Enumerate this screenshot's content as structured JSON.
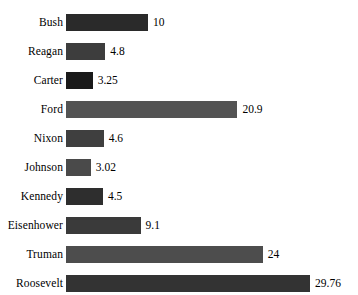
{
  "page": {
    "title_remnant": "",
    "background": "#ffffff",
    "text_color": "#000000"
  },
  "chart_data": {
    "type": "bar",
    "orientation": "horizontal",
    "title": "",
    "subtitle": "",
    "xlabel": "",
    "ylabel": "",
    "grid": false,
    "legend": null,
    "axis_visible": false,
    "xlim": [
      0,
      29.76
    ],
    "categories": [
      "Bush",
      "Reagan",
      "Carter",
      "Ford",
      "Nixon",
      "Johnson",
      "Kennedy",
      "Eisenhower",
      "Truman",
      "Roosevelt"
    ],
    "values": [
      10,
      4.8,
      3.25,
      20.9,
      4.6,
      3.02,
      4.5,
      9.1,
      24,
      29.76
    ],
    "value_labels": [
      "10",
      "4.8",
      "3.25",
      "20.9",
      "4.6",
      "3.02",
      "4.5",
      "9.1",
      "24",
      "29.76"
    ],
    "bar_colors": [
      "#2a2a2a",
      "#3d3d3d",
      "#1a1a1a",
      "#535353",
      "#3f3f3f",
      "#4a4a4a",
      "#2e2e2e",
      "#3a3a3a",
      "#4d4d4d",
      "#333333"
    ],
    "bars": [
      {
        "category": "Bush",
        "value": 10,
        "label": "10",
        "color": "#2a2a2a"
      },
      {
        "category": "Reagan",
        "value": 4.8,
        "label": "4.8",
        "color": "#3d3d3d"
      },
      {
        "category": "Carter",
        "value": 3.25,
        "label": "3.25",
        "color": "#1a1a1a"
      },
      {
        "category": "Ford",
        "value": 20.9,
        "label": "20.9",
        "color": "#535353"
      },
      {
        "category": "Nixon",
        "value": 4.6,
        "label": "4.6",
        "color": "#3f3f3f"
      },
      {
        "category": "Johnson",
        "value": 3.02,
        "label": "3.02",
        "color": "#4a4a4a"
      },
      {
        "category": "Kennedy",
        "value": 4.5,
        "label": "4.5",
        "color": "#2e2e2e"
      },
      {
        "category": "Eisenhower",
        "value": 9.1,
        "label": "9.1",
        "color": "#3a3a3a"
      },
      {
        "category": "Truman",
        "value": 24,
        "label": "24",
        "color": "#4d4d4d"
      },
      {
        "category": "Roosevelt",
        "value": 29.76,
        "label": "29.76",
        "color": "#333333"
      }
    ]
  },
  "layout": {
    "bar_origin_px": 69,
    "px_per_unit": 8.2,
    "bar_height_px": 17,
    "row_pitch_px": 29
  }
}
